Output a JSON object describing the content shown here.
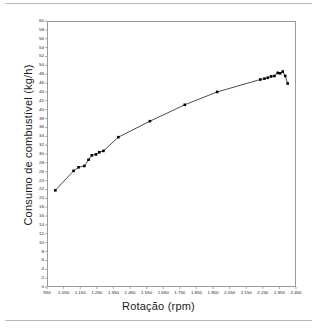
{
  "figure": {
    "background_color": "#ffffff",
    "frame_color": "#9a9a9a",
    "rule_color": "#b9b9b9",
    "series_color": "#000000"
  },
  "axes": {
    "x_title": "Rotação (rpm)",
    "y_title": "Consumo de combustível (kg/h)",
    "x_tick_labels": [
      "950",
      "1.050",
      "1.150",
      "1.250",
      "1.350",
      "1.450",
      "1.550",
      "1.650",
      "1.750",
      "1.850",
      "1.950",
      "2.050",
      "2.150",
      "2.250",
      "2.350",
      "2.450"
    ],
    "y_tick_labels": [
      "60",
      "58",
      "56",
      "54",
      "52",
      "50",
      "48",
      "46",
      "44",
      "42",
      "40",
      "38",
      "36",
      "34",
      "32",
      "30",
      "28",
      "26",
      "24",
      "22",
      "20",
      "18",
      "16",
      "14",
      "12",
      "10",
      "8",
      "6",
      "4",
      "2",
      "0"
    ]
  },
  "chart_data": {
    "type": "line",
    "title": "",
    "xlabel": "Rotação (rpm)",
    "ylabel": "Consumo de combustível (kg/h)",
    "xlim": [
      950,
      2450
    ],
    "ylim": [
      0,
      60
    ],
    "x_tick_step": 100,
    "y_tick_step": 2,
    "grid": false,
    "legend": false,
    "marker": "filled-square",
    "series": [
      {
        "name": "Consumo de combustível",
        "x": [
          1000,
          1110,
          1140,
          1175,
          1200,
          1220,
          1245,
          1265,
          1290,
          1380,
          1570,
          1780,
          1975,
          2235,
          2260,
          2280,
          2300,
          2320,
          2340,
          2355,
          2370,
          2385,
          2400
        ],
        "values": [
          21.8,
          26.2,
          27.0,
          27.3,
          28.7,
          29.7,
          29.9,
          30.4,
          30.7,
          33.8,
          37.4,
          41.1,
          44.0,
          46.8,
          47.0,
          47.2,
          47.5,
          47.6,
          48.3,
          48.2,
          48.6,
          47.6,
          45.9
        ]
      }
    ]
  }
}
